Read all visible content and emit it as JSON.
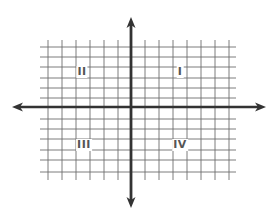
{
  "diagram": {
    "type": "coordinate-plane",
    "colors": {
      "grid": "#6e6e6e",
      "axis": "#333333",
      "label": "#555555",
      "background": "#ffffff"
    },
    "axes": {
      "x_axis": {
        "y": 107,
        "x_start": 12,
        "x_end": 266
      },
      "y_axis": {
        "x": 131,
        "y_start": 17,
        "y_end": 208
      }
    },
    "grid": {
      "vertical_lines_x": [
        48,
        62,
        76,
        90,
        104,
        118,
        145,
        159,
        173,
        187,
        201,
        215,
        229
      ],
      "horizontal_lines_y": [
        47,
        57,
        67,
        78,
        88,
        98,
        119,
        129,
        139,
        150,
        160,
        172
      ],
      "x_extent": [
        40,
        236
      ],
      "y_extent": [
        40,
        180
      ]
    },
    "quadrants": [
      {
        "id": "I",
        "label": "I",
        "x": 180,
        "y": 72
      },
      {
        "id": "II",
        "label": "II",
        "x": 82,
        "y": 72
      },
      {
        "id": "III",
        "label": "III",
        "x": 84,
        "y": 145
      },
      {
        "id": "IV",
        "label": "IV",
        "x": 180,
        "y": 145
      }
    ]
  }
}
